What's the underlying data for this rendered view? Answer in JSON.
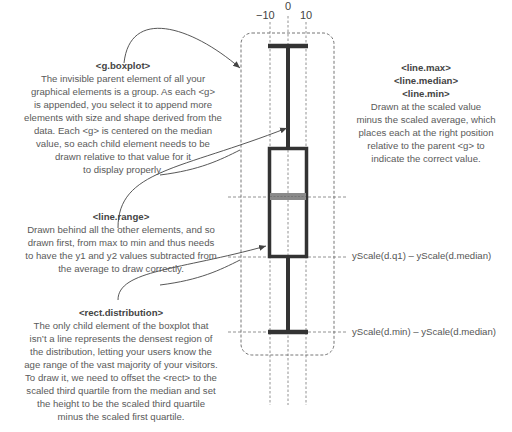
{
  "axis": {
    "ticks": [
      {
        "label": "−10",
        "x": 270
      },
      {
        "label": "0",
        "x": 288
      },
      {
        "label": "10",
        "x": 306
      }
    ]
  },
  "annotations": {
    "boxplot": {
      "title": "<g.boxplot>",
      "lines": [
        "The invisible parent element of all your",
        "graphical elements is a group. As each <g>",
        "is appended, you select it to append more",
        "elements with size and shape derived from the",
        "data. Each <g> is centered on the  median",
        "value, so each child element needs to be",
        "drawn relative to that value for it",
        "to display properly."
      ]
    },
    "lines_max_median_min": {
      "titles": [
        "<line.max>",
        "<line.median>",
        "<line.min>"
      ],
      "lines": [
        "Drawn at the scaled value",
        "minus the scaled average, which",
        "places each at the right position",
        "relative to the parent <g> to",
        "indicate the correct value."
      ]
    },
    "range": {
      "title": "<line.range>",
      "lines": [
        "Drawn behind all the other elements, and so",
        "drawn first, from max to min and thus needs",
        "to have the y1 and y2 values subtracted from",
        "the average to draw correctly."
      ]
    },
    "distribution": {
      "title": "<rect.distribution>",
      "lines": [
        "The only child element of the boxplot that",
        "isn’t a line represents the densest region of",
        "the distribution, letting your users know the",
        "age range of the vast majority of your visitors.",
        "To draw it, we need to offset the <rect> to the",
        "scaled third quartile from the median and set",
        "the height to be the scaled third quartile",
        "minus the scaled first quartile."
      ]
    }
  },
  "formulas": {
    "q1": "yScale(d.q1) – yScale(d.median)",
    "min": "yScale(d.min) – yScale(d.median)"
  },
  "colors": {
    "stroke": "#333333",
    "median": "#888888",
    "dashed": "#666666",
    "arrow": "#444444"
  }
}
